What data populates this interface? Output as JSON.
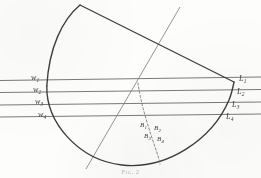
{
  "figure": {
    "caption": "Fig. 2",
    "stroke_color": "#3c3c3a",
    "light_stroke_color": "#8d8d88",
    "background_color": "#fdfdfb",
    "left_labels": [
      {
        "base": "w",
        "sub": "1",
        "x": 31,
        "y": 74
      },
      {
        "base": "w",
        "sub": "2",
        "x": 33,
        "y": 86
      },
      {
        "base": "w",
        "sub": "3",
        "x": 35,
        "y": 98
      },
      {
        "base": "w",
        "sub": "4",
        "x": 38,
        "y": 111
      }
    ],
    "right_labels": [
      {
        "base": "L",
        "sub": "1",
        "x": 239,
        "y": 75
      },
      {
        "base": "L",
        "sub": "2",
        "x": 237,
        "y": 88
      },
      {
        "base": "L",
        "sub": "3",
        "x": 232,
        "y": 101
      },
      {
        "base": "L",
        "sub": "4",
        "x": 226,
        "y": 113
      }
    ],
    "inner_labels": [
      {
        "base": "B",
        "sub": "1",
        "x": 140,
        "y": 122
      },
      {
        "base": "B",
        "sub": "2",
        "x": 154,
        "y": 125
      },
      {
        "base": "B",
        "sub": "3",
        "x": 144,
        "y": 133
      },
      {
        "base": "B",
        "sub": "4",
        "x": 157,
        "y": 136
      }
    ],
    "caption_position": {
      "x": 0,
      "y": 168
    },
    "horizontal_lines": [
      {
        "name": "w1-L1",
        "x1": 0,
        "y1": 80.5,
        "x2": 261,
        "y2": 77.0
      },
      {
        "name": "w2-L2",
        "x1": 0,
        "y1": 92.5,
        "x2": 261,
        "y2": 89.5
      },
      {
        "name": "w3-L3",
        "x1": 0,
        "y1": 105.0,
        "x2": 261,
        "y2": 102.0
      },
      {
        "name": "w4-L4",
        "x1": 0,
        "y1": 117.0,
        "x2": 261,
        "y2": 114.0
      }
    ],
    "oblique_line": {
      "name": "oblique-ray",
      "x1": 180,
      "y1": 7,
      "x2": 86,
      "y2": 169
    },
    "outline": {
      "apex": {
        "x": 80,
        "y": 5
      },
      "right_vertex": {
        "x": 234,
        "y": 82
      },
      "left_arc_extreme": {
        "x": 46.5,
        "y": 100
      },
      "bottom_arc_extreme": {
        "x": 158,
        "y": 165
      }
    },
    "dashed_curve": {
      "name": "dashed-b-curve",
      "start": {
        "x": 138,
        "y": 83
      },
      "end": {
        "x": 160,
        "y": 164
      }
    }
  }
}
